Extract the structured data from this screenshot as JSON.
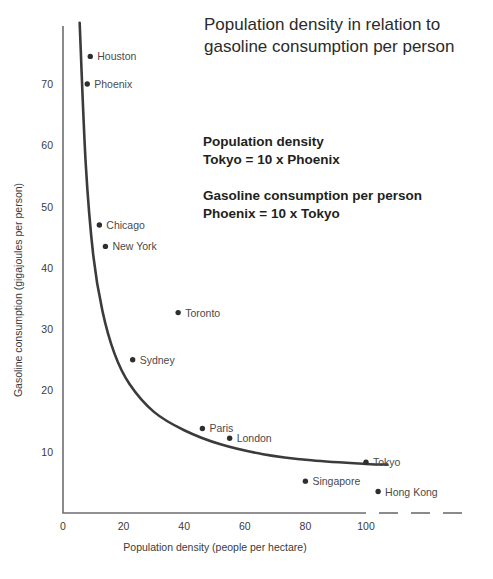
{
  "chart_data": {
    "type": "scatter",
    "title": "Population density in relation to gasoline consumption per person",
    "title_line1": "Population density in relation to",
    "title_line2": "gasoline consumption per person",
    "xlabel": "Population density (people per hectare)",
    "ylabel": "Gasoline consumption (gigajoules per person)",
    "xlim": [
      0,
      108
    ],
    "ylim": [
      0,
      80
    ],
    "xticks": [
      0,
      20,
      40,
      60,
      80,
      100
    ],
    "yticks": [
      10,
      20,
      30,
      40,
      50,
      60,
      70
    ],
    "grid": false,
    "legend": null,
    "axis_break": "dashed extension beyond 100 on x-axis",
    "points": [
      {
        "label": "Houston",
        "x": 9,
        "y": 74.5,
        "label_side": "right"
      },
      {
        "label": "Phoenix",
        "x": 8,
        "y": 70.0,
        "label_side": "right"
      },
      {
        "label": "Chicago",
        "x": 12,
        "y": 47.0,
        "label_side": "right"
      },
      {
        "label": "New York",
        "x": 14,
        "y": 43.5,
        "label_side": "right"
      },
      {
        "label": "Toronto",
        "x": 38,
        "y": 32.7,
        "label_side": "right"
      },
      {
        "label": "Sydney",
        "x": 23,
        "y": 25.0,
        "label_side": "right"
      },
      {
        "label": "Paris",
        "x": 46,
        "y": 13.8,
        "label_side": "right"
      },
      {
        "label": "London",
        "x": 55,
        "y": 12.2,
        "label_side": "right"
      },
      {
        "label": "Tokyo",
        "x": 100,
        "y": 8.3,
        "label_side": "right"
      },
      {
        "label": "Singapore",
        "x": 80,
        "y": 5.2,
        "label_side": "right"
      },
      {
        "label": "Hong Kong",
        "x": 104,
        "y": 3.5,
        "label_side": "right"
      }
    ],
    "trend_curve": {
      "description": "hyperbolic decay fit through the city points",
      "points": [
        {
          "x": 5.5,
          "y": 80.0
        },
        {
          "x": 7.5,
          "y": 57.0
        },
        {
          "x": 10.0,
          "y": 42.0
        },
        {
          "x": 13.0,
          "y": 33.0
        },
        {
          "x": 17.0,
          "y": 26.0
        },
        {
          "x": 22.0,
          "y": 21.0
        },
        {
          "x": 30.0,
          "y": 16.5
        },
        {
          "x": 40.0,
          "y": 13.5
        },
        {
          "x": 52.0,
          "y": 11.2
        },
        {
          "x": 66.0,
          "y": 9.6
        },
        {
          "x": 82.0,
          "y": 8.6
        },
        {
          "x": 100.0,
          "y": 8.0
        },
        {
          "x": 107.0,
          "y": 7.9
        }
      ]
    },
    "annotations": [
      {
        "id": "population-density-callout",
        "line1": "Population density",
        "line2": "Tokyo = 10 x Phoenix"
      },
      {
        "id": "gasoline-consumption-callout",
        "line1": "Gasoline consumption per person",
        "line2": "Phoenix = 10 x Tokyo"
      }
    ],
    "colors": {
      "axis": "#6d6e71",
      "curve": "#3b3b3b",
      "dot": "#2e2e2e",
      "text": "#3a3a3a",
      "title": "#2b2b2b",
      "background": "#ffffff"
    }
  }
}
